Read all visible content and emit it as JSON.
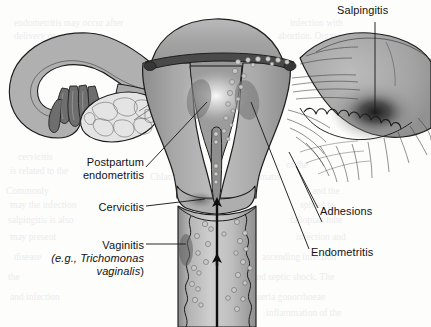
{
  "figure": {
    "width": 431,
    "height": 327,
    "background_color": "#fdfdfc"
  },
  "labels": {
    "salpingitis": "Salpingitis",
    "postpartum_line1": "Postpartum",
    "postpartum_line2": "endometritis",
    "cervicitis": "Cervicitis",
    "vaginitis_line1": "Vaginitis",
    "vaginitis_eg": "(e.g., ",
    "vaginitis_species1": "Trichomonas",
    "vaginitis_species2": "vaginalis",
    "vaginitis_close": ")",
    "adhesions": "Adhesions",
    "endometritis": "Endometritis"
  },
  "anatomy": {
    "uterus": "uterus-body",
    "fundus": "uterine-fundus",
    "endometrial_cavity": "endometrial-cavity",
    "cervix": "cervix",
    "cervical_canal": "cervical-canal",
    "vagina": "vaginal-canal",
    "vaginal_rugae": "vaginal-rugae",
    "left_fallopian_tube": "left-fallopian-tube",
    "left_fimbriae": "left-fimbriae",
    "left_ovary": "left-ovary",
    "right_fallopian_tube": "right-fallopian-tube-inflamed",
    "right_fimbriae": "right-fimbriae",
    "adhesion_strands": "adhesion-strands",
    "inflammation_focus": "inflammation-focus"
  },
  "annotations": {
    "ascending_arrows": 2,
    "arrow_meaning": "ascending-infection-direction",
    "organism_dots": "pathogen-organisms"
  },
  "colors": {
    "tissue_fill": "#a5a5a5",
    "tissue_fill_light": "#c2c2c2",
    "tissue_fill_dark": "#8e8e8e",
    "cavity_dark": "#4a4a4a",
    "outline": "#1d1d1d",
    "organism_fill": "#c9c9c9",
    "arrow_black": "#0d0d0d",
    "label_text": "#121212",
    "background": "#fdfdfc",
    "ghost_text": "#ececec"
  },
  "ghost_text": [
    {
      "t": "endometritis  may occur after",
      "x": 14,
      "y": 18
    },
    {
      "t": "infection with",
      "x": 290,
      "y": 18
    },
    {
      "t": "delivery or",
      "x": 14,
      "y": 31
    },
    {
      "t": "abortion. Organisms",
      "x": 278,
      "y": 31
    },
    {
      "t": "cervicitis",
      "x": 18,
      "y": 152
    },
    {
      "t": "of the",
      "x": 286,
      "y": 160
    },
    {
      "t": "is related to the",
      "x": 10,
      "y": 166
    },
    {
      "t": "Chlamydia",
      "x": 150,
      "y": 172
    },
    {
      "t": "trachomatis",
      "x": 236,
      "y": 172
    },
    {
      "t": "Commonly",
      "x": 6,
      "y": 186
    },
    {
      "t": "and the",
      "x": 312,
      "y": 186
    },
    {
      "t": "may the infection",
      "x": 10,
      "y": 200
    },
    {
      "t": "spread to",
      "x": 300,
      "y": 200
    },
    {
      "t": "salpingitis is also",
      "x": 8,
      "y": 215
    },
    {
      "t": "fallopian tube",
      "x": 290,
      "y": 215
    },
    {
      "t": "may present",
      "x": 10,
      "y": 232
    },
    {
      "t": "infection and",
      "x": 296,
      "y": 232
    },
    {
      "t": "disease",
      "x": 14,
      "y": 252
    },
    {
      "t": "ascending infection",
      "x": 262,
      "y": 252
    },
    {
      "t": "the",
      "x": 8,
      "y": 272
    },
    {
      "t": "and septic shock. The",
      "x": 252,
      "y": 272
    },
    {
      "t": "and infection",
      "x": 10,
      "y": 292
    },
    {
      "t": "Neisseria gonorrhoeae",
      "x": 240,
      "y": 292
    },
    {
      "t": "inflammation of the",
      "x": 266,
      "y": 308
    }
  ]
}
